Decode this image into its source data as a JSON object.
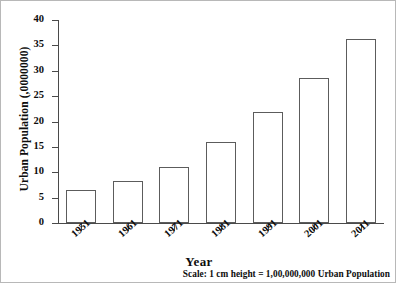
{
  "chart_data": {
    "type": "bar",
    "title": "",
    "xlabel": "Year",
    "ylabel": "Urban Population (,0000000)",
    "categories": [
      "1951",
      "1961",
      "1971",
      "1981",
      "1991",
      "2001",
      "2011"
    ],
    "values": [
      6.5,
      8.2,
      11.1,
      16.0,
      21.8,
      28.6,
      36.2
    ],
    "ylim": [
      0,
      40
    ],
    "ytick_labels": [
      "0",
      "5",
      "10",
      "15",
      "20",
      "25",
      "30",
      "35",
      "40"
    ],
    "ytick_values": [
      0,
      5,
      10,
      15,
      20,
      25,
      30,
      35,
      40
    ],
    "grid": false,
    "legend": "none",
    "bar_face_color": "#ffffff",
    "bar_edge_color": "#5c5c5c",
    "axis_color": "#4a4a4a",
    "text_color": "#0d0d0d",
    "annotation": "Scale: 1 cm height = 1,00,000,000 Urban Population"
  }
}
